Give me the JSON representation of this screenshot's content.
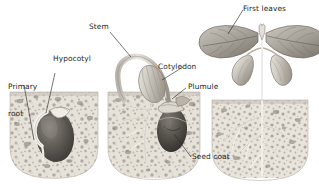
{
  "figure": {
    "background_color": "#ffffff",
    "ink_color": "#231f20",
    "style": "grayscale stipple / pencil botanical illustration"
  },
  "labels": [
    {
      "id": "primary-root",
      "text": "Primary\nroot",
      "x": 8,
      "y": 68,
      "lines": [
        "Primary",
        "root"
      ]
    },
    {
      "id": "hypocotyl",
      "text": "Hypocotyl",
      "x": 53,
      "y": 56,
      "lines": [
        "Hypocotyl"
      ]
    },
    {
      "id": "stem",
      "text": "Stem",
      "x": 88,
      "y": 24,
      "lines": [
        "Stem"
      ]
    },
    {
      "id": "cotyledon",
      "text": "Cotyledon",
      "x": 158,
      "y": 64,
      "lines": [
        "Cotyledon"
      ]
    },
    {
      "id": "plumule",
      "text": "Plumule",
      "x": 188,
      "y": 84,
      "lines": [
        "Plumule"
      ]
    },
    {
      "id": "first-leaves",
      "text": "First leaves",
      "x": 243,
      "y": 6,
      "lines": [
        "First leaves"
      ]
    },
    {
      "id": "seed-coat",
      "text": "Seed coat",
      "x": 193,
      "y": 157,
      "lines": [
        "Seed coat"
      ]
    }
  ],
  "stages": [
    {
      "id": "stage-1",
      "name": "germinating seed below ground",
      "soil_block": {
        "x": 10,
        "y": 92,
        "w": 88,
        "h": 86
      },
      "features": [
        "seed",
        "seed coat",
        "primary root",
        "hypocotyl arch"
      ]
    },
    {
      "id": "stage-2",
      "name": "seedling emerging with hooked hypocotyl",
      "soil_block": {
        "x": 108,
        "y": 92,
        "w": 92,
        "h": 86
      },
      "features": [
        "hooked stem",
        "cotyledon",
        "plumule",
        "seed coat",
        "branching roots"
      ]
    },
    {
      "id": "stage-3",
      "name": "young plant with first true leaves",
      "soil_block": {
        "x": 212,
        "y": 100,
        "w": 96,
        "h": 78
      },
      "features": [
        "first leaves",
        "two cotyledons",
        "stem",
        "developed root system"
      ]
    }
  ],
  "colors": {
    "soil_light": "#e3ded6",
    "soil_mid": "#b9b3aa",
    "soil_dark": "#8d867c",
    "pebble": "#7c756b",
    "seed_dark": "#4a4843",
    "seed_mid": "#6e6b64",
    "plant_light": "#d8d5cf",
    "plant_mid": "#9e9a93",
    "leader_line": "#2b2b2b"
  }
}
